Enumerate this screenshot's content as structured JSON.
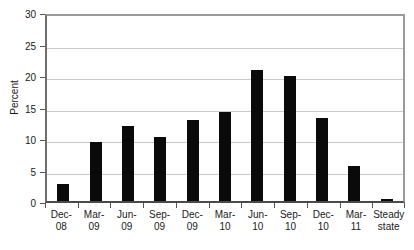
{
  "chart_data": {
    "type": "bar",
    "title": "",
    "xlabel": "",
    "ylabel": "Percent",
    "ylim": [
      0,
      30
    ],
    "yticks": [
      0,
      5,
      10,
      15,
      20,
      25,
      30
    ],
    "grid": true,
    "legend": "none",
    "bar_color": "#0a0a0a",
    "categories": [
      "Dec-08",
      "Mar-09",
      "Jun-09",
      "Sep-09",
      "Dec-09",
      "Mar-10",
      "Jun-10",
      "Sep-10",
      "Dec-10",
      "Mar-11",
      "Steady state"
    ],
    "category_lines": [
      {
        "line1": "Dec-",
        "line2": "08"
      },
      {
        "line1": "Mar-",
        "line2": "09"
      },
      {
        "line1": "Jun-",
        "line2": "09"
      },
      {
        "line1": "Sep-",
        "line2": "09"
      },
      {
        "line1": "Dec-",
        "line2": "09"
      },
      {
        "line1": "Mar-",
        "line2": "10"
      },
      {
        "line1": "Jun-",
        "line2": "10"
      },
      {
        "line1": "Sep-",
        "line2": "10"
      },
      {
        "line1": "Dec-",
        "line2": "10"
      },
      {
        "line1": "Mar-",
        "line2": "11"
      },
      {
        "line1": "Steady",
        "line2": "state"
      }
    ],
    "values": [
      2.7,
      9.4,
      11.9,
      10.2,
      12.8,
      14.2,
      20.8,
      19.8,
      13.2,
      5.5,
      0.3
    ]
  }
}
